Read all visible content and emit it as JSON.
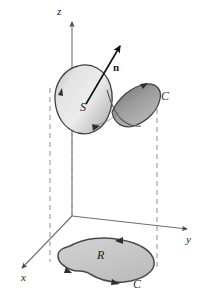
{
  "figure": {
    "type": "3d-vector-calculus-diagram",
    "background_color": "#ffffff"
  },
  "axes": {
    "z": {
      "label": "z",
      "direction": "up"
    },
    "y": {
      "label": "y",
      "direction": "right"
    },
    "x": {
      "label": "x",
      "direction": "down-left"
    },
    "origin": {
      "x": 72,
      "y": 216
    },
    "color": "#6e6e6e"
  },
  "surface": {
    "label": "S",
    "description": "saddle-shaped oriented surface",
    "fill_light": "#d8d8d8",
    "fill_dark": "#8f8f8f",
    "outline_color": "#3a3a3a"
  },
  "normal": {
    "label": "n",
    "description": "unit normal vector to surface S",
    "color": "#111111"
  },
  "boundary_curve": {
    "label": "C",
    "description": "oriented boundary curve of surface S",
    "color": "#3a3a3a"
  },
  "region": {
    "label": "R",
    "description": "projection region in the xy-plane",
    "fill": "#c9c9c9",
    "outline_color": "#4a4a4a"
  },
  "projected_curve": {
    "label": "C",
    "description": "oriented boundary curve of region R",
    "color": "#3a3a3a"
  },
  "dashed_lines": {
    "description": "vertical projection lines from curve C to region R",
    "color": "#9a9a9a",
    "count": 3
  }
}
